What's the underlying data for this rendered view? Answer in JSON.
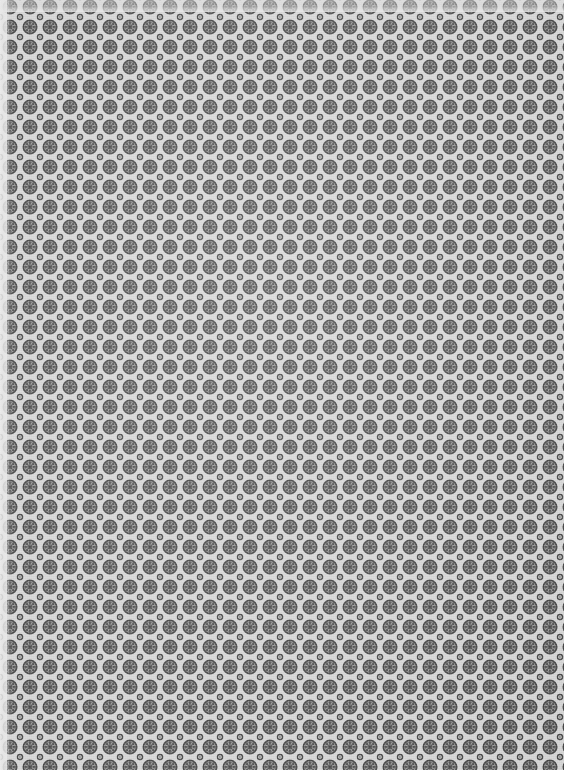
{
  "image": {
    "kind": "textile-pattern-swatch",
    "description": "Repeating grayscale floral-geometric lattice, photographed fabric or wallpaper",
    "width_px": 564,
    "height_px": 770
  },
  "pattern": {
    "lattice": "square",
    "period_x_px": 20,
    "period_y_px": 20,
    "secondary_offset": "half-period diagonal",
    "primary_motif": {
      "name": "rosette",
      "diameter_px": 15,
      "petal_count": 8,
      "has_center_dot": true,
      "has_outer_ring": true
    },
    "secondary_motif": {
      "name": "small-ring",
      "diameter_px": 6,
      "has_center_dot": true
    }
  },
  "colors": {
    "background": "#d4d4d4",
    "background_light": "#e2e2e2",
    "motif_mid": "#8d8d8d",
    "motif_dark": "#595959",
    "motif_outline": "#4a4a4a",
    "edge_wash": "#ececec"
  },
  "edges": {
    "left_band_px": 11,
    "right_band_px": 7,
    "bottom_band_px": 12,
    "top_band_px": 5
  }
}
